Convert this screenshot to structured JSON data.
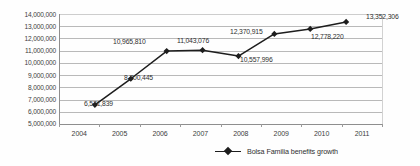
{
  "chart_data": {
    "type": "line",
    "title": "",
    "xlabel": "",
    "ylabel": "",
    "categories": [
      "2004",
      "2005",
      "2006",
      "2007",
      "2008",
      "2009",
      "2010",
      "2011"
    ],
    "values": [
      6571839,
      8700445,
      10965810,
      11043076,
      10557996,
      12370915,
      12778220,
      13352306
    ],
    "point_labels": [
      "6,571,839",
      "8,700,445",
      "10,965,810",
      "11,043,076",
      "10,557,996",
      "12,370,915",
      "12,778,220",
      "13,352,306"
    ],
    "series": [
      {
        "name": "Bolsa Familia benefits growth",
        "values": [
          6571839,
          8700445,
          10965810,
          11043076,
          10557996,
          12370915,
          12778220,
          13352306
        ]
      }
    ],
    "ylim": [
      5000000,
      14000000
    ],
    "ytick_values": [
      5000000,
      6000000,
      7000000,
      8000000,
      9000000,
      10000000,
      11000000,
      12000000,
      13000000,
      14000000
    ],
    "ytick_labels": [
      "5,000,000",
      "6,000,000",
      "7,000,000",
      "8,000,000",
      "9,000,000",
      "10,000,000",
      "11,000,000",
      "12,000,000",
      "13,000,000",
      "14,000,000"
    ],
    "grid": "horizontal",
    "legend_position": "bottom",
    "legend": [
      "Bolsa Familia benefits growth"
    ],
    "marker": "diamond",
    "line_color": "#1d1d1d",
    "grid_color": "#b9b9b9",
    "axis_color": "#8e8e8e"
  },
  "legend": {
    "entry_label": "Bolsa Familia benefits growth"
  }
}
